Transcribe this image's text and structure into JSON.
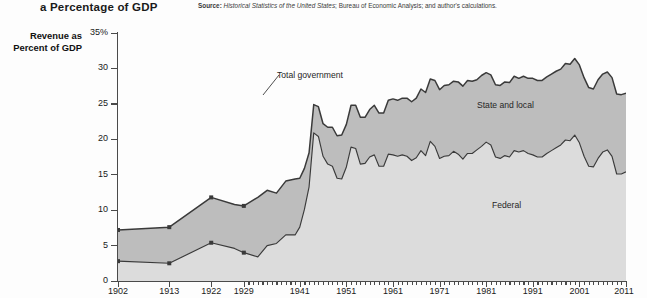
{
  "header": {
    "title": "a Percentage of GDP",
    "source_label": "Source:",
    "source_italic": "Historical Statistics of the United States",
    "source_rest": "; Bureau of Economic Analysis; and author's calculations."
  },
  "axis_title": "Revenue as Percent of GDP",
  "annotations": {
    "total": "Total government",
    "state_local": "State and local",
    "federal": "Federal"
  },
  "colors": {
    "federal_fill": "#dcdcdc",
    "state_local_fill": "#bdbdbd",
    "line": "#3a3a3a",
    "axis": "#4a4a4a",
    "background": "#fdfdfd"
  },
  "chart_data": {
    "type": "area",
    "title": "a Percentage of GDP",
    "subtitle": "",
    "xlabel": "",
    "ylabel": "Revenue as Percent of GDP",
    "ylim": [
      0,
      35
    ],
    "xlim": [
      1902,
      2011
    ],
    "grid": false,
    "legend": "in-plot labels",
    "ytick_labels": [
      "0",
      "5",
      "10",
      "15",
      "20",
      "25",
      "30",
      "35%"
    ],
    "ytick_values": [
      0,
      5,
      10,
      15,
      20,
      25,
      30,
      35
    ],
    "xtick_labels": [
      "1902",
      "1913",
      "1922",
      "1929",
      "1941",
      "1951",
      "1961",
      "1971",
      "1981",
      "1991",
      "2001",
      "2011"
    ],
    "xtick_values": [
      1902,
      1913,
      1922,
      1929,
      1941,
      1951,
      1961,
      1971,
      1981,
      1991,
      2001,
      2011
    ],
    "stacked": true,
    "x": [
      1902,
      1913,
      1922,
      1927,
      1929,
      1932,
      1934,
      1936,
      1938,
      1940,
      1941,
      1942,
      1943,
      1944,
      1945,
      1946,
      1947,
      1948,
      1949,
      1950,
      1951,
      1952,
      1953,
      1954,
      1955,
      1956,
      1957,
      1958,
      1959,
      1960,
      1961,
      1962,
      1963,
      1964,
      1965,
      1966,
      1967,
      1968,
      1969,
      1970,
      1971,
      1972,
      1973,
      1974,
      1975,
      1976,
      1977,
      1978,
      1979,
      1980,
      1981,
      1982,
      1983,
      1984,
      1985,
      1986,
      1987,
      1988,
      1989,
      1990,
      1991,
      1992,
      1993,
      1994,
      1995,
      1996,
      1997,
      1998,
      1999,
      2000,
      2001,
      2002,
      2003,
      2004,
      2005,
      2006,
      2007,
      2008,
      2009,
      2010,
      2011
    ],
    "series": [
      {
        "name": "Federal",
        "values": [
          2.8,
          2.5,
          5.4,
          4.6,
          4.0,
          3.4,
          5.0,
          5.3,
          6.5,
          6.5,
          7.6,
          10.1,
          13.3,
          20.9,
          20.4,
          17.6,
          16.5,
          16.2,
          14.5,
          14.4,
          16.1,
          18.9,
          18.7,
          16.5,
          16.6,
          17.5,
          17.8,
          16.2,
          16.2,
          17.9,
          17.8,
          17.6,
          17.8,
          17.6,
          17.0,
          17.4,
          18.4,
          17.7,
          19.7,
          19.0,
          17.3,
          17.6,
          17.7,
          18.3,
          17.9,
          17.2,
          18.0,
          18.0,
          18.5,
          19.0,
          19.6,
          19.2,
          17.5,
          17.3,
          17.7,
          17.5,
          18.4,
          18.2,
          18.4,
          18.0,
          17.8,
          17.5,
          17.5,
          18.0,
          18.4,
          18.8,
          19.2,
          19.9,
          19.8,
          20.6,
          19.5,
          17.6,
          16.2,
          16.1,
          17.3,
          18.2,
          18.5,
          17.6,
          15.1,
          15.1,
          15.4
        ]
      },
      {
        "name": "State and local",
        "values": [
          4.4,
          5.1,
          6.4,
          6.2,
          6.6,
          8.4,
          7.8,
          7.1,
          7.6,
          7.9,
          6.9,
          5.8,
          4.8,
          4.0,
          4.2,
          4.6,
          5.2,
          5.5,
          6.0,
          6.2,
          6.0,
          5.9,
          6.1,
          6.6,
          6.5,
          6.7,
          7.0,
          7.5,
          7.5,
          7.6,
          7.9,
          7.9,
          8.0,
          8.2,
          8.3,
          8.4,
          8.7,
          8.9,
          8.8,
          9.3,
          9.7,
          10.0,
          10.0,
          9.9,
          10.2,
          10.3,
          10.3,
          10.2,
          9.9,
          10.0,
          9.8,
          9.9,
          10.2,
          10.3,
          10.4,
          10.5,
          10.5,
          10.4,
          10.5,
          10.6,
          10.8,
          10.8,
          10.8,
          10.8,
          10.8,
          10.8,
          10.7,
          10.8,
          10.8,
          10.8,
          11.0,
          11.1,
          11.1,
          11.0,
          11.1,
          11.0,
          11.0,
          11.1,
          11.3,
          11.2,
          11.1
        ]
      }
    ],
    "total_label_points": {
      "1902": 7.2,
      "1913": 7.6,
      "1922": 11.8,
      "1929": 10.6,
      "1944": 24.9,
      "1945": 24.6,
      "2000": 31.4,
      "2011": 26.5
    },
    "marker_years": [
      1902,
      1913,
      1922,
      1929
    ]
  }
}
